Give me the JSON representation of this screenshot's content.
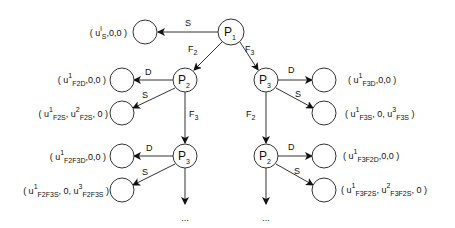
{
  "diagram": {
    "type": "tree",
    "nodes": {
      "p1": {
        "main": "P",
        "sub": "1"
      },
      "p2_left": {
        "main": "P",
        "sub": "2"
      },
      "p3_right": {
        "main": "P",
        "sub": "3"
      },
      "p3_left_lower": {
        "main": "P",
        "sub": "3"
      },
      "p2_right_lower": {
        "main": "P",
        "sub": "2"
      }
    },
    "edges": {
      "p1_s": "S",
      "p1_f2": {
        "main": "F",
        "sub": "2"
      },
      "p1_f3": {
        "main": "F",
        "sub": "3"
      },
      "p2_d": "D",
      "p2_s": "S",
      "p2_f3": {
        "main": "F",
        "sub": "3"
      },
      "p3_d": "D",
      "p3_s": "S",
      "p3_f2": {
        "main": "F",
        "sub": "2"
      },
      "p3l_d": "D",
      "p3l_s": "S",
      "p2r_d": "D",
      "p2r_s": "S"
    },
    "payoffs": {
      "s": {
        "open": "( u",
        "sup1": "l",
        "sub1": "S",
        "rest": ",0,0 )"
      },
      "f2d": {
        "open": "( u",
        "sup1": "1",
        "sub1": "F2D",
        "rest": ",0,0 )"
      },
      "f2s": {
        "open": "( u",
        "sup1": "1",
        "sub1": "F2S",
        "mid": ", u",
        "sup2": "2",
        "sub2": "F2S",
        "rest": ", 0 )"
      },
      "f2f3d": {
        "open": "( u",
        "sup1": "1",
        "sub1": "F2F3D",
        "rest": ",0,0 )"
      },
      "f2f3s": {
        "open": "( u",
        "sup1": "1",
        "sub1": "F2F3S",
        "mid": ", 0, u",
        "sup2": "3",
        "sub2": "F2F3S",
        "rest": " )"
      },
      "f3d": {
        "open": "( u",
        "sup1": "1",
        "sub1": "F3D",
        "rest": ",0,0 )"
      },
      "f3s": {
        "open": "( u",
        "sup1": "1",
        "sub1": "F3S",
        "mid": ", 0, u",
        "sup2": "3",
        "sub2": "F3S",
        "rest": " )"
      },
      "f3f2d": {
        "open": "( u",
        "sup1": "1",
        "sub1": "F3F2D",
        "rest": ",0,0 )"
      },
      "f3f2s": {
        "open": "( u",
        "sup1": "1",
        "sub1": "F3F2S",
        "mid": ", u",
        "sup2": "2",
        "sub2": "F3F2S",
        "rest": ", 0 )"
      }
    },
    "continuation": {
      "left": "...",
      "right": "..."
    }
  }
}
